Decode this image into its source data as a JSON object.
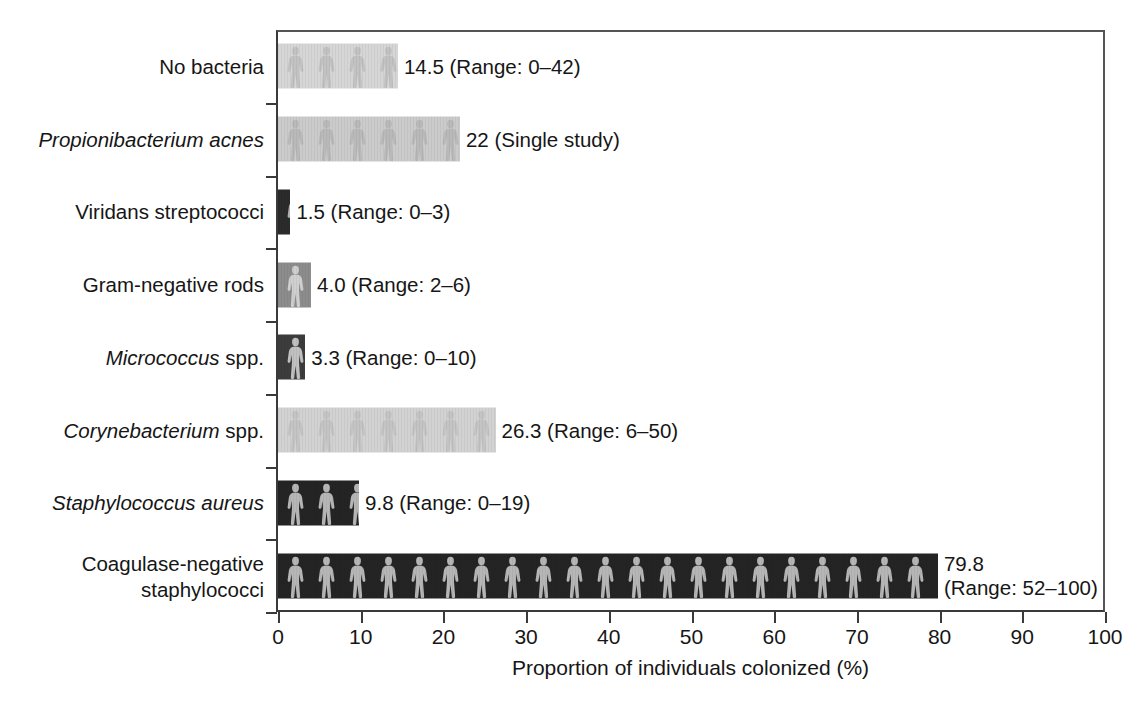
{
  "chart_data": {
    "type": "bar",
    "orientation": "horizontal",
    "title": "",
    "xlabel": "Proportion of individuals colonized (%)",
    "ylabel": "",
    "xlim": [
      0,
      100
    ],
    "xticks": [
      0,
      10,
      20,
      30,
      40,
      50,
      60,
      70,
      80,
      90,
      100
    ],
    "xticklabels": [
      "0",
      "10",
      "20",
      "30",
      "40",
      "50",
      "60",
      "70",
      "80",
      "90",
      "100"
    ],
    "grid": false,
    "legend": false,
    "pictogram_fill": "human-figure-silhouette",
    "categories": [
      "No bacteria",
      "Propionibacterium acnes",
      "Viridans streptococci",
      "Gram-negative rods",
      "Micrococcus spp.",
      "Corynebacterium spp.",
      "Staphylococcus aureus",
      "Coagulase-negative staphylococci"
    ],
    "values": [
      14.5,
      22,
      1.5,
      4.0,
      3.3,
      26.3,
      9.8,
      79.8
    ],
    "bars": [
      {
        "category": "No bacteria",
        "label_html": "No bacteria",
        "label_italic_part": "",
        "value": 14.5,
        "value_text": "14.5",
        "range_text": "(Range: 0–42)",
        "annotation": "14.5 (Range: 0–42)",
        "range_low": 0,
        "range_high": 42,
        "color": "#d6d6d6",
        "figure_color": "#c2c2c2"
      },
      {
        "category": "Propionibacterium acnes",
        "label_html": "Propionibacterium acnes",
        "label_italic_part": "Propionibacterium acnes",
        "value": 22,
        "value_text": "22",
        "range_text": "(Single study)",
        "annotation": "22 (Single study)",
        "range_low": null,
        "range_high": null,
        "color": "#cbcbcb",
        "figure_color": "#b9b9b9"
      },
      {
        "category": "Viridans streptococci",
        "label_html": "Viridans streptococci",
        "label_italic_part": "",
        "value": 1.5,
        "value_text": "1.5",
        "range_text": "(Range: 0–3)",
        "annotation": "1.5 (Range: 0–3)",
        "range_low": 0,
        "range_high": 3,
        "color": "#2b2b2b",
        "figure_color": "#b0b0b0"
      },
      {
        "category": "Gram-negative rods",
        "label_html": "Gram-negative rods",
        "label_italic_part": "",
        "value": 4.0,
        "value_text": "4.0",
        "range_text": "(Range: 2–6)",
        "annotation": "4.0 (Range: 2–6)",
        "range_low": 2,
        "range_high": 6,
        "color": "#8c8c8c",
        "figure_color": "#cfcfcf"
      },
      {
        "category": "Micrococcus spp.",
        "label_html": "Micrococcus spp.",
        "label_italic_part": "Micrococcus",
        "value": 3.3,
        "value_text": "3.3",
        "range_text": "(Range: 0–10)",
        "annotation": "3.3 (Range: 0–10)",
        "range_low": 0,
        "range_high": 10,
        "color": "#3c3c3c",
        "figure_color": "#c0c0c0"
      },
      {
        "category": "Corynebacterium spp.",
        "label_html": "Corynebacterium spp.",
        "label_italic_part": "Corynebacterium",
        "value": 26.3,
        "value_text": "26.3",
        "range_text": "(Range: 6–50)",
        "annotation": "26.3 (Range: 6–50)",
        "range_low": 6,
        "range_high": 50,
        "color": "#d2d2d2",
        "figure_color": "#c4c4c4"
      },
      {
        "category": "Staphylococcus aureus",
        "label_html": "Staphylococcus aureus",
        "label_italic_part": "Staphylococcus aureus",
        "value": 9.8,
        "value_text": "9.8",
        "range_text": "(Range: 0–19)",
        "annotation": "9.8 (Range: 0–19)",
        "range_low": 0,
        "range_high": 19,
        "color": "#242424",
        "figure_color": "#b6b6b6"
      },
      {
        "category": "Coagulase-negative staphylococci",
        "label_html": "Coagulase-negative\nstaphylococci",
        "label_italic_part": "",
        "value": 79.8,
        "value_text": "79.8",
        "range_text": "(Range: 52–100)",
        "annotation": "79.8\n(Range: 52–100)",
        "range_low": 52,
        "range_high": 100,
        "color": "#242424",
        "figure_color": "#b6b6b6"
      }
    ]
  },
  "axis": {
    "x_title": "Proportion of individuals colonized (%)",
    "tick_labels": [
      "0",
      "10",
      "20",
      "30",
      "40",
      "50",
      "60",
      "70",
      "80",
      "90",
      "100"
    ]
  },
  "style": {
    "axis_color": "#3a3a3a",
    "text_color": "#161616",
    "background": "#ffffff"
  }
}
